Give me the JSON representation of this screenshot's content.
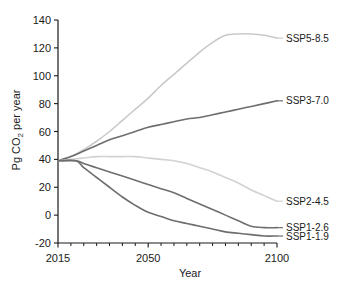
{
  "chart_data": {
    "type": "line",
    "title": "",
    "xlabel": "Year",
    "ylabel": "Pg CO2 per year",
    "ylabel_parts": {
      "pre": "Pg CO",
      "sub": "2",
      "post": " per year"
    },
    "xlim": [
      2015,
      2100
    ],
    "ylim": [
      -20,
      140
    ],
    "xticks": [
      2015,
      2050,
      2100
    ],
    "xticklabels": [
      "2015",
      "2050",
      "2100"
    ],
    "xminorticks": [
      2020,
      2025,
      2030,
      2035,
      2040,
      2045,
      2055,
      2060,
      2065,
      2070,
      2075,
      2080,
      2085,
      2090,
      2095
    ],
    "yticks": [
      -20,
      0,
      20,
      40,
      60,
      80,
      100,
      120,
      140
    ],
    "yticklabels": [
      "-20",
      "0",
      "20",
      "40",
      "60",
      "80",
      "100",
      "120",
      "140"
    ],
    "grid": false,
    "legend_position": "right-inline-labels",
    "series": [
      {
        "name": "SSP5-8.5",
        "color": "#c9c9c9",
        "label_x": 2100,
        "label_y": 127,
        "x": [
          2015,
          2020,
          2025,
          2030,
          2035,
          2040,
          2045,
          2050,
          2055,
          2060,
          2065,
          2070,
          2075,
          2080,
          2085,
          2090,
          2095,
          2100
        ],
        "values": [
          39,
          42,
          47,
          53,
          60,
          68,
          76,
          84,
          93,
          101,
          109,
          117,
          124,
          129,
          130,
          130,
          129,
          127
        ]
      },
      {
        "name": "SSP3-7.0",
        "color": "#6e6e6e",
        "label_x": 2100,
        "label_y": 82,
        "x": [
          2015,
          2020,
          2025,
          2030,
          2035,
          2040,
          2045,
          2050,
          2055,
          2060,
          2065,
          2070,
          2075,
          2080,
          2085,
          2090,
          2095,
          2100
        ],
        "values": [
          39,
          42,
          46,
          50,
          54,
          57,
          60,
          63,
          65,
          67,
          69,
          70,
          72,
          74,
          76,
          78,
          80,
          82
        ]
      },
      {
        "name": "SSP2-4.5",
        "color": "#d2d2d2",
        "label_x": 2100,
        "label_y": 10,
        "x": [
          2015,
          2020,
          2025,
          2030,
          2035,
          2040,
          2045,
          2050,
          2055,
          2060,
          2065,
          2070,
          2075,
          2080,
          2085,
          2090,
          2095,
          2100
        ],
        "values": [
          39,
          40,
          41,
          42,
          42,
          42,
          42,
          41,
          40,
          39,
          37,
          34,
          31,
          27,
          23,
          18,
          14,
          10
        ]
      },
      {
        "name": "SSP1-2.6",
        "color": "#6e6e6e",
        "label_x": 2100,
        "label_y": -9,
        "x": [
          2015,
          2022,
          2025,
          2030,
          2035,
          2040,
          2045,
          2050,
          2055,
          2060,
          2065,
          2070,
          2075,
          2080,
          2085,
          2090,
          2095,
          2100
        ],
        "values": [
          39,
          39,
          37,
          34,
          31,
          28,
          25,
          22,
          19,
          16,
          12,
          8,
          4,
          0,
          -4,
          -8,
          -9,
          -9
        ]
      },
      {
        "name": "SSP1-1.9",
        "color": "#6e6e6e",
        "label_x": 2100,
        "label_y": -15,
        "x": [
          2015,
          2022,
          2025,
          2030,
          2035,
          2040,
          2045,
          2050,
          2055,
          2060,
          2065,
          2070,
          2075,
          2080,
          2085,
          2090,
          2095,
          2100
        ],
        "values": [
          39,
          39,
          34,
          27,
          20,
          13,
          7,
          2,
          -1,
          -4,
          -6,
          -8,
          -10,
          -12,
          -13,
          -14,
          -15,
          -15
        ]
      }
    ]
  }
}
